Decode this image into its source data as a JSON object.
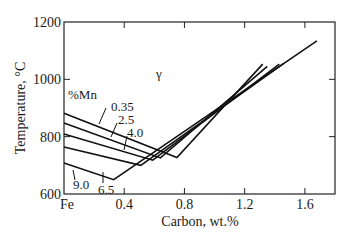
{
  "chart_data": {
    "type": "line",
    "title": "",
    "xlabel": "Carbon, wt.%",
    "ylabel": "Temperature, °C",
    "xlim": [
      0,
      1.8
    ],
    "ylim": [
      600,
      1200
    ],
    "x_ticks": [
      0,
      0.4,
      0.8,
      1.2,
      1.6
    ],
    "x_tick_labels": [
      "Fe",
      "0.4",
      "0.8",
      "1.2",
      "1.6"
    ],
    "y_ticks": [
      600,
      800,
      1000,
      1200
    ],
    "y_tick_labels": [
      "600",
      "800",
      "1000",
      "1200"
    ],
    "grid": false,
    "legend_title": "%Mn",
    "region_label": "γ",
    "series": [
      {
        "name": "0.35",
        "points": [
          [
            0,
            882
          ],
          [
            0.75,
            727
          ],
          [
            1.32,
            1053
          ]
        ]
      },
      {
        "name": "2.5",
        "points": [
          [
            0,
            848
          ],
          [
            0.64,
            726
          ],
          [
            1.35,
            1045
          ]
        ]
      },
      {
        "name": "4.0",
        "points": [
          [
            0,
            809
          ],
          [
            0.59,
            718
          ],
          [
            1.43,
            1053
          ]
        ]
      },
      {
        "name": "6.5",
        "points": [
          [
            0,
            764
          ],
          [
            0.51,
            700
          ],
          [
            1.46,
            1056
          ]
        ]
      },
      {
        "name": "9.0",
        "points": [
          [
            0,
            708
          ],
          [
            0.33,
            650
          ],
          [
            1.68,
            1134
          ]
        ]
      }
    ]
  }
}
